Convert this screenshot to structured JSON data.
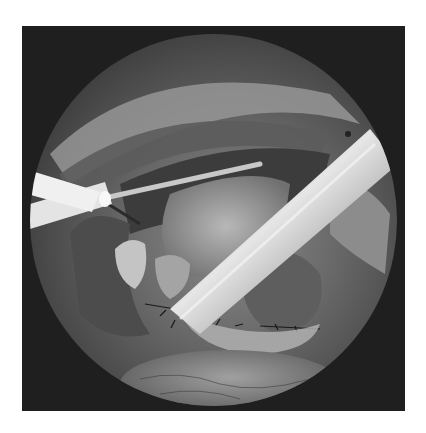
{
  "image": {
    "description": "Grayscale laparoscopic surgical view within a circular endoscope field on a dark square background",
    "scene_elements": [
      "white-cannula-left",
      "thin-probe-across-top",
      "metallic-trocar-instrument-diagonal",
      "liver-tissue-center",
      "sutures-and-clips-lower-center",
      "fatty-tissue-bottom",
      "abdominal-wall-upper-arc"
    ],
    "colors": {
      "page_background": "#ffffff",
      "frame_background": "#1f1f1f",
      "tissue_mid": "#6a6a6a",
      "instrument_highlight": "#e0e0e0"
    }
  }
}
